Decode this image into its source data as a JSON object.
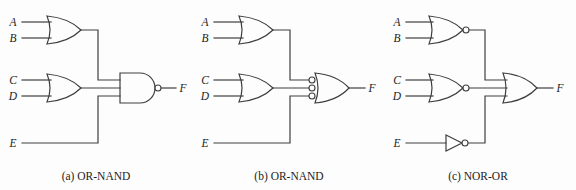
{
  "figure": {
    "description_colors": {
      "background": "#fdfdfd",
      "stroke": "#3f3f3f",
      "text": "#1c1c1c"
    }
  },
  "panels": [
    {
      "id": "a",
      "caption": "(a) OR-NAND",
      "inputs": {
        "a": "A",
        "b": "B",
        "c": "C",
        "d": "D",
        "e": "E"
      },
      "output": "F",
      "gates": [
        "or-gate",
        "or-gate",
        "nand-gate"
      ]
    },
    {
      "id": "b",
      "caption": "(b) OR-NAND",
      "inputs": {
        "a": "A",
        "b": "B",
        "c": "C",
        "d": "D",
        "e": "E"
      },
      "output": "F",
      "gates": [
        "or-gate",
        "or-gate",
        "negated-input-or-gate"
      ]
    },
    {
      "id": "c",
      "caption": "(c) NOR-OR",
      "inputs": {
        "a": "A",
        "b": "B",
        "c": "C",
        "d": "D",
        "e": "E"
      },
      "output": "F",
      "gates": [
        "nor-gate",
        "nor-gate",
        "not-gate",
        "or-gate"
      ]
    }
  ]
}
